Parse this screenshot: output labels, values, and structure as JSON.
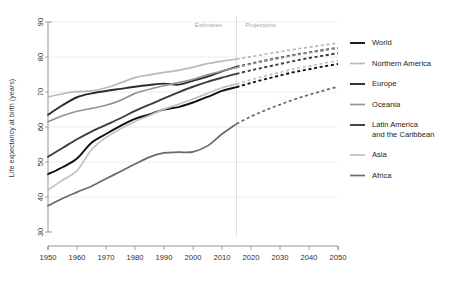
{
  "chart_data": {
    "type": "line",
    "title": "",
    "subtitle": "",
    "xlabel": "",
    "ylabel": "Life expectancy at birth (years)",
    "xlim": [
      1950,
      2050
    ],
    "ylim": [
      30,
      90
    ],
    "xticks": [
      1950,
      1960,
      1970,
      1980,
      1990,
      2000,
      2010,
      2020,
      2030,
      2040,
      2050
    ],
    "yticks": [
      30,
      40,
      50,
      60,
      70,
      80,
      90
    ],
    "grid": "horizontal",
    "legend_position": "right",
    "annotations": [
      {
        "text": "Estimates",
        "x": 2010,
        "y": 88.5,
        "align": "end"
      },
      {
        "text": "Projections",
        "x": 2018,
        "y": 88.5,
        "align": "start"
      }
    ],
    "phase_divider_year": 2015,
    "estimate_span": [
      1950,
      2015
    ],
    "projection_span": [
      2015,
      2050
    ],
    "x_estimates": [
      1950,
      1955,
      1960,
      1965,
      1970,
      1975,
      1980,
      1985,
      1990,
      1995,
      2000,
      2005,
      2010,
      2015
    ],
    "x_projections": [
      2015,
      2020,
      2025,
      2030,
      2035,
      2040,
      2045,
      2050
    ],
    "series": [
      {
        "name": "World",
        "color": "#111111",
        "width": 1.9,
        "estimates": [
          46.5,
          48.5,
          51.0,
          55.5,
          58.0,
          60.3,
          62.3,
          63.6,
          65.0,
          65.7,
          67.0,
          68.6,
          70.3,
          71.4
        ],
        "projections": [
          71.4,
          72.6,
          73.7,
          74.7,
          75.7,
          76.5,
          77.3,
          78.0
        ]
      },
      {
        "name": "Northern America",
        "color": "#b9b9b9",
        "width": 1.7,
        "estimates": [
          68.6,
          69.5,
          70.1,
          70.3,
          71.2,
          72.6,
          74.1,
          74.9,
          75.6,
          76.2,
          77.1,
          78.1,
          78.8,
          79.4
        ],
        "projections": [
          79.4,
          80.1,
          80.8,
          81.5,
          82.2,
          82.8,
          83.4,
          84.0
        ]
      },
      {
        "name": "Europe",
        "color": "#2b2b2b",
        "width": 1.9,
        "estimates": [
          63.5,
          66.2,
          68.5,
          69.6,
          70.3,
          70.9,
          71.5,
          72.0,
          72.4,
          72.1,
          73.2,
          74.4,
          75.9,
          77.2
        ],
        "projections": [
          77.2,
          78.1,
          79.0,
          79.8,
          80.6,
          81.3,
          82.0,
          82.6
        ]
      },
      {
        "name": "Oceania",
        "color": "#949494",
        "width": 1.7,
        "estimates": [
          61.5,
          63.2,
          64.5,
          65.3,
          66.2,
          67.6,
          69.6,
          70.8,
          71.8,
          72.7,
          73.6,
          74.9,
          76.0,
          77.0
        ],
        "projections": [
          77.0,
          78.0,
          78.9,
          79.7,
          80.5,
          81.2,
          81.9,
          82.5
        ]
      },
      {
        "name": "Latin America and the Caribbean",
        "color": "#3d3d3d",
        "width": 1.9,
        "estimates": [
          51.5,
          54.0,
          56.5,
          58.7,
          60.6,
          62.5,
          64.6,
          66.4,
          68.2,
          69.9,
          71.5,
          72.9,
          74.1,
          75.2
        ],
        "projections": [
          75.2,
          76.2,
          77.1,
          78.0,
          78.9,
          79.7,
          80.4,
          81.1
        ]
      },
      {
        "name": "Asia",
        "color": "#c2c2c2",
        "width": 1.7,
        "estimates": [
          42.0,
          44.8,
          47.5,
          53.5,
          57.0,
          59.5,
          61.6,
          63.3,
          65.1,
          66.5,
          68.0,
          69.6,
          71.2,
          72.3
        ],
        "projections": [
          72.3,
          73.5,
          74.6,
          75.6,
          76.6,
          77.4,
          78.2,
          79.0
        ]
      },
      {
        "name": "Africa",
        "color": "#6a6a6a",
        "width": 1.7,
        "estimates": [
          37.5,
          39.6,
          41.4,
          43.1,
          45.2,
          47.3,
          49.4,
          51.4,
          52.6,
          52.8,
          52.9,
          54.6,
          58.0,
          60.9
        ],
        "projections": [
          60.9,
          63.0,
          64.8,
          66.4,
          67.9,
          69.2,
          70.4,
          71.5
        ]
      }
    ]
  },
  "legend": {
    "items": [
      {
        "label": "World",
        "color": "#111111",
        "width": 1.9
      },
      {
        "label": "Northern America",
        "color": "#b9b9b9",
        "width": 1.7
      },
      {
        "label": "Europe",
        "color": "#2b2b2b",
        "width": 1.9
      },
      {
        "label": "Oceania",
        "color": "#949494",
        "width": 1.7
      },
      {
        "label": "Latin America",
        "label2": "and the Caribbean",
        "color": "#3d3d3d",
        "width": 1.9
      },
      {
        "label": "Asia",
        "color": "#c2c2c2",
        "width": 1.7
      },
      {
        "label": "Africa",
        "color": "#6a6a6a",
        "width": 1.7
      }
    ]
  },
  "axis": {
    "y_title": "Life expectancy at birth (years)"
  }
}
